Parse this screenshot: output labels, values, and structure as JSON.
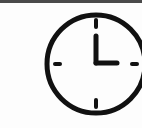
{
  "icon": {
    "name": "clock-icon",
    "time_shown": "3:00",
    "stroke_color": "#111111",
    "background_color": "#fdfdfd",
    "topbar_color": "#4a4a4a"
  }
}
